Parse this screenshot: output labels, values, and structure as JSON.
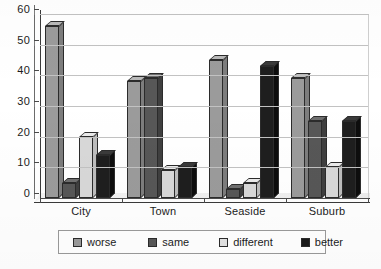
{
  "chart_data": {
    "type": "bar",
    "title": "",
    "subtitle": "",
    "xlabel": "",
    "ylabel": "",
    "categories": [
      "City",
      "Town",
      "Seaside",
      "Suburb"
    ],
    "series": [
      {
        "name": "worse",
        "color": "#9b9b9b",
        "values": [
          56,
          38,
          45,
          39
        ]
      },
      {
        "name": "same",
        "color": "#575757",
        "values": [
          5,
          39,
          3,
          25
        ]
      },
      {
        "name": "different",
        "color": "#d8d8d8",
        "values": [
          20,
          9,
          5,
          10
        ]
      },
      {
        "name": "better",
        "color": "#1e1e1e",
        "values": [
          14,
          10,
          43,
          25
        ]
      }
    ],
    "ylim": [
      0,
      60
    ],
    "ytick_step": 10,
    "ytick_labels": [
      "0",
      "10",
      "20",
      "30",
      "40",
      "50",
      "60"
    ],
    "grid": true,
    "grid_axis": "y",
    "legend_position": "bottom",
    "style": "3d-clustered-bar",
    "annotations": []
  },
  "legend": {
    "items": [
      {
        "label": "worse",
        "swatch": "swatch-worse"
      },
      {
        "label": "same",
        "swatch": "swatch-same"
      },
      {
        "label": "different",
        "swatch": "swatch-different"
      },
      {
        "label": "better",
        "swatch": "swatch-better"
      }
    ]
  }
}
